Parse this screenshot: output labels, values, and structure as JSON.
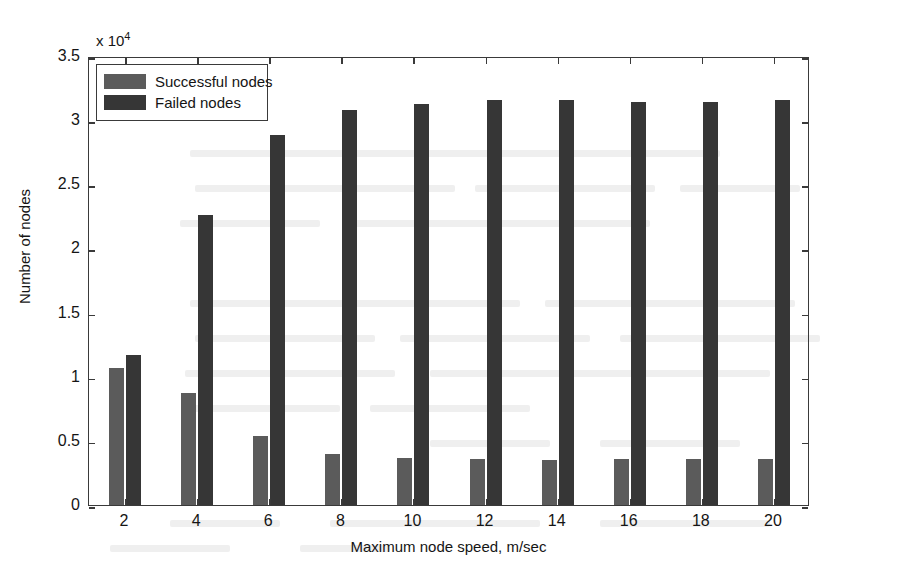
{
  "chart_data": {
    "type": "bar",
    "title": "",
    "xlabel": "Maximum node speed, m/sec",
    "ylabel": "Number of nodes",
    "y_exponent_label": "x 10",
    "y_exponent_power": "4",
    "y_scale": 10000,
    "categories": [
      2,
      4,
      6,
      8,
      10,
      12,
      14,
      16,
      18,
      20
    ],
    "xtick_labels": [
      "2",
      "4",
      "6",
      "8",
      "10",
      "12",
      "14",
      "16",
      "18",
      "20"
    ],
    "ytick_labels": [
      "0",
      "0.5",
      "1",
      "1.5",
      "2",
      "2.5",
      "3",
      "3.5"
    ],
    "ytick_values": [
      0,
      5000,
      10000,
      15000,
      20000,
      25000,
      30000,
      35000
    ],
    "ylim": [
      0,
      35000
    ],
    "xlim": [
      1,
      21
    ],
    "grid": false,
    "legend_position": "top-left",
    "series": [
      {
        "name": "Successful nodes",
        "color": "#5b5b5b",
        "values": [
          10650,
          8750,
          5400,
          4000,
          3650,
          3580,
          3520,
          3580,
          3580,
          3570
        ]
      },
      {
        "name": "Failed nodes",
        "color": "#363636",
        "values": [
          11700,
          22600,
          28850,
          30800,
          31250,
          31550,
          31550,
          31450,
          31450,
          31600
        ]
      }
    ]
  },
  "legend": {
    "entries": [
      {
        "label": "Successful nodes",
        "color": "#5b5b5b"
      },
      {
        "label": "Failed nodes",
        "color": "#363636"
      }
    ]
  }
}
